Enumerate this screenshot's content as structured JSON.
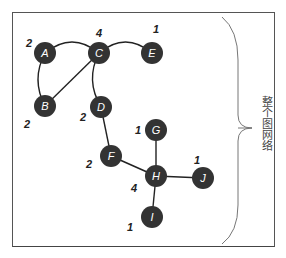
{
  "diagram": {
    "side_label": "整个图网络",
    "node_color": "#333333",
    "node_text_color": "#ffffff",
    "edge_color": "#222222",
    "nodes": [
      {
        "id": "A",
        "label": "A",
        "degree": "2",
        "x": 45,
        "y": 53,
        "dx": -16,
        "dy": -10
      },
      {
        "id": "C",
        "label": "C",
        "degree": "4",
        "x": 99,
        "y": 53,
        "dx": 0,
        "dy": -20
      },
      {
        "id": "E",
        "label": "E",
        "degree": "1",
        "x": 152,
        "y": 53,
        "dx": 4,
        "dy": -24
      },
      {
        "id": "B",
        "label": "B",
        "degree": "2",
        "x": 45,
        "y": 106,
        "dx": -18,
        "dy": 18
      },
      {
        "id": "D",
        "label": "D",
        "degree": "2",
        "x": 101,
        "y": 107,
        "dx": -18,
        "dy": 10
      },
      {
        "id": "G",
        "label": "G",
        "degree": "1",
        "x": 156,
        "y": 130,
        "dx": -18,
        "dy": 0
      },
      {
        "id": "F",
        "label": "F",
        "degree": "2",
        "x": 111,
        "y": 156,
        "dx": -22,
        "dy": 8
      },
      {
        "id": "H",
        "label": "H",
        "degree": "4",
        "x": 156,
        "y": 176,
        "dx": -22,
        "dy": 12
      },
      {
        "id": "J",
        "label": "J",
        "degree": "1",
        "x": 203,
        "y": 178,
        "dx": -6,
        "dy": -18
      },
      {
        "id": "I",
        "label": "I",
        "degree": "1",
        "x": 152,
        "y": 217,
        "dx": -22,
        "dy": 10
      }
    ],
    "edges": [
      {
        "from": "A",
        "to": "C",
        "curve": "arc-up"
      },
      {
        "from": "C",
        "to": "E",
        "curve": "arc-up"
      },
      {
        "from": "A",
        "to": "B",
        "curve": "arc-left"
      },
      {
        "from": "B",
        "to": "C",
        "curve": "straight"
      },
      {
        "from": "C",
        "to": "D",
        "curve": "arc-left"
      },
      {
        "from": "D",
        "to": "F",
        "curve": "straight"
      },
      {
        "from": "F",
        "to": "H",
        "curve": "straight"
      },
      {
        "from": "G",
        "to": "H",
        "curve": "straight"
      },
      {
        "from": "H",
        "to": "J",
        "curve": "straight"
      },
      {
        "from": "H",
        "to": "I",
        "curve": "straight"
      }
    ]
  }
}
